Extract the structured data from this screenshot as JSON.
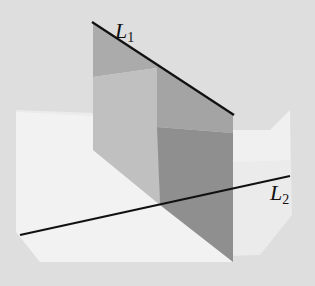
{
  "figure": {
    "labels": {
      "line1": {
        "main": "L",
        "sub": "1"
      },
      "line2": {
        "main": "L",
        "sub": "2"
      }
    },
    "colors": {
      "background": "#dedede",
      "horizontal_plane": "#ececec",
      "horizontal_plane_light": "#f3f3f3",
      "vertical_plane_upper_left": "#ababab",
      "vertical_plane_lower_left": "#bfbfbf",
      "vertical_plane_upper_right": "#a3a3a3",
      "vertical_plane_lower_right": "#8e8e8e",
      "line": "#111111"
    }
  }
}
